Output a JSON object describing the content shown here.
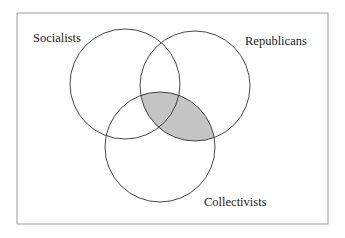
{
  "diagram": {
    "type": "venn",
    "sets": [
      {
        "id": "socialists",
        "label": "Socialists",
        "cx": 125,
        "cy": 84,
        "r": 55,
        "label_x": 33,
        "label_y": 42
      },
      {
        "id": "republicans",
        "label": "Republicans",
        "cx": 195,
        "cy": 86,
        "r": 55,
        "label_x": 245,
        "label_y": 45
      },
      {
        "id": "collectivists",
        "label": "Collectivists",
        "cx": 160,
        "cy": 147,
        "r": 55,
        "label_x": 204,
        "label_y": 206
      }
    ],
    "shaded_region": "republicans ∩ collectivists",
    "colors": {
      "stroke": "#333333",
      "shade": "#c4c4c4",
      "frame": "#888888"
    }
  }
}
